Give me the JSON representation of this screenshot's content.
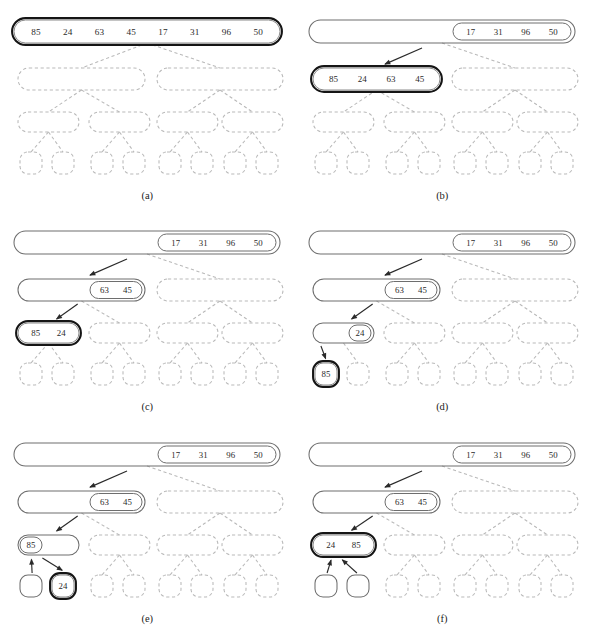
{
  "figure": {
    "background": "#ffffff",
    "colors": {
      "ghost": "#b9b9b9",
      "solid": "#6e6e6e",
      "active_outer": "#151515",
      "active_inner": "#8a8a8a",
      "arrow": "#2a2a2a",
      "text": "#2a2a2a",
      "caption": "#1b1b1b"
    },
    "input_array": [
      85,
      24,
      63,
      45,
      17,
      31,
      96,
      50
    ],
    "panels": [
      {
        "id": "a",
        "caption": "(a)",
        "description": "Full unsorted array at root, highlighted; entire recursion tree unexplored.",
        "root_values": [
          85,
          24,
          63,
          45,
          17,
          31,
          96,
          50
        ],
        "root_state": "active",
        "split_values": [],
        "arrows": 0
      },
      {
        "id": "b",
        "caption": "(b)",
        "description": "Root split: right half 17 31 96 50 remains in root; left half 85 24 63 45 recursed into.",
        "root_remainder": [
          17,
          31,
          96,
          50
        ],
        "root_state": "visited",
        "active_node": {
          "level": 2,
          "index": 0,
          "values": [
            85,
            24,
            63,
            45
          ]
        },
        "arrows": 1
      },
      {
        "id": "c",
        "caption": "(c)",
        "description": "Level-2 node split: 63 45 remains, 85 24 recursed into.",
        "root_remainder": [
          17,
          31,
          96,
          50
        ],
        "level2_remainder": [
          63,
          45
        ],
        "active_node": {
          "level": 3,
          "index": 0,
          "values": [
            85,
            24
          ]
        },
        "arrows": 2
      },
      {
        "id": "d",
        "caption": "(d)",
        "description": "Level-3 node split: 24 remains, single element 85 reaches base case.",
        "root_remainder": [
          17,
          31,
          96,
          50
        ],
        "level2_remainder": [
          63,
          45
        ],
        "level3_remainder": [
          24
        ],
        "active_node": {
          "level": 4,
          "index": 0,
          "values": [
            85
          ]
        },
        "arrows": 3
      },
      {
        "id": "e",
        "caption": "(e)",
        "description": "First leaf returns 85 to parent; second leaf 24 now active base case.",
        "root_remainder": [
          17,
          31,
          96,
          50
        ],
        "level2_remainder": [
          63,
          45
        ],
        "level3_remainder": [
          85
        ],
        "active_node": {
          "level": 4,
          "index": 1,
          "values": [
            24
          ]
        },
        "arrows": 3,
        "return_arrows": 1
      },
      {
        "id": "f",
        "caption": "(f)",
        "description": "Both leaves returned; merged result 24 85 held in level-3 node.",
        "root_remainder": [
          17,
          31,
          96,
          50
        ],
        "level2_remainder": [
          63,
          45
        ],
        "active_node": {
          "level": 3,
          "index": 0,
          "values": [
            24,
            85
          ]
        },
        "arrows": 2,
        "return_arrows": 2
      }
    ],
    "captions": {
      "a": "(a)",
      "b": "(b)",
      "c": "(c)",
      "d": "(d)",
      "e": "(e)",
      "f": "(f)"
    },
    "values": {
      "root_full": [
        "85",
        "24",
        "63",
        "45",
        "17",
        "31",
        "96",
        "50"
      ],
      "root_right": [
        "17",
        "31",
        "96",
        "50"
      ],
      "half_left": [
        "85",
        "24",
        "63",
        "45"
      ],
      "quarter_right": [
        "63",
        "45"
      ],
      "pair_8524": [
        "85",
        "24"
      ],
      "pair_2485": [
        "24",
        "85"
      ],
      "single_24": "24",
      "single_85": "85"
    }
  }
}
